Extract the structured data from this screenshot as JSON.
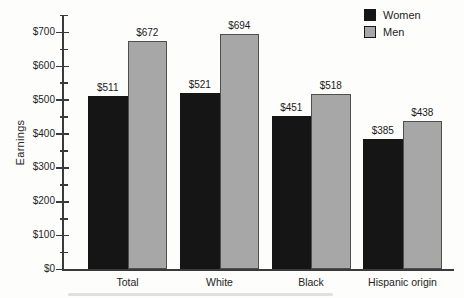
{
  "figure": {
    "background": "#fdfdfc"
  },
  "chart_data": {
    "type": "bar",
    "title": "",
    "xlabel": "",
    "ylabel": "Earnings",
    "categories": [
      "Total",
      "White",
      "Black",
      "Hispanic origin"
    ],
    "series": [
      {
        "name": "Women",
        "color": "#151515",
        "values": [
          511,
          521,
          451,
          385
        ],
        "value_labels": [
          "$511",
          "$521",
          "$451",
          "$385"
        ]
      },
      {
        "name": "Men",
        "color": "#a7a7a7",
        "border_color": "#4f4f4f",
        "values": [
          672,
          694,
          518,
          438
        ],
        "value_labels": [
          "$672",
          "$694",
          "$518",
          "$438"
        ]
      }
    ],
    "y_axis": {
      "min": 0,
      "max": 750,
      "major_step": 100,
      "minor_step": 50,
      "tick_labels": [
        "$0",
        "$100",
        "$200",
        "$300",
        "$400",
        "$500",
        "$600",
        "$700"
      ]
    },
    "legend": {
      "position": "top-right",
      "entries": [
        "Women",
        "Men"
      ]
    },
    "grid": false,
    "axis_color": "#3a3a3a",
    "text_color": "#1d1d1d"
  }
}
